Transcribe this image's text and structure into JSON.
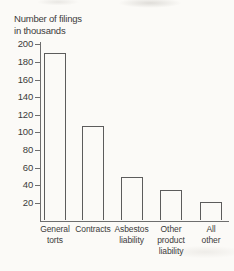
{
  "title": {
    "line1": "Number of filings",
    "line2": "in thousands"
  },
  "chart_data": {
    "type": "bar",
    "title": "Number of filings in thousands",
    "ylabel": "Number of filings in thousands",
    "xlabel": "",
    "categories": [
      "General torts",
      "Contracts",
      "Asbestos liability",
      "Other product liability",
      "All other"
    ],
    "category_lines": [
      [
        "General",
        "torts"
      ],
      [
        "Contracts"
      ],
      [
        "Asbestos",
        "liability"
      ],
      [
        "Other",
        "product",
        "liability"
      ],
      [
        "All",
        "other"
      ]
    ],
    "values": [
      190,
      107,
      49,
      35,
      21
    ],
    "y_ticks": [
      200,
      180,
      160,
      140,
      120,
      100,
      80,
      60,
      40,
      20
    ],
    "ylim": [
      0,
      200
    ],
    "grid": false,
    "legend_position": "none"
  },
  "colors": {
    "background": "#fbfaf7",
    "axis": "#6e6e6e",
    "bar_outline": "#5c5c5c",
    "text": "#3b3b3b"
  }
}
